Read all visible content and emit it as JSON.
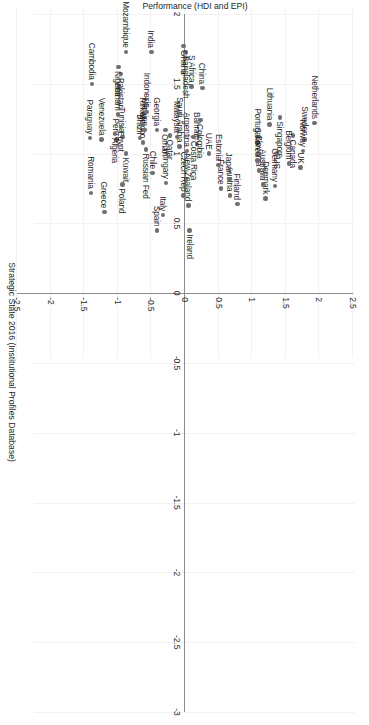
{
  "chart_data": {
    "type": "scatter",
    "title": "",
    "xlabel": "Strategic State 2016 (Institutional Profiles Database)",
    "ylabel": "Performance (HDI and EPI)",
    "xlim": [
      -3,
      2
    ],
    "ylim": [
      -2.5,
      2.5
    ],
    "xticks": [
      2,
      1.5,
      1,
      0.5,
      0,
      -0.5,
      -1,
      -1.5,
      -2,
      -2.5,
      -3
    ],
    "xticklabels": [
      "2",
      "1.5",
      "1",
      "0.5",
      "0",
      "-0.5",
      "-1",
      "-1.5",
      "-2",
      "-2.5",
      "-3"
    ],
    "yticks": [
      2.5,
      2,
      1.5,
      1,
      0.5,
      0,
      -0.5,
      -1,
      -1.5,
      -2,
      -2.5
    ],
    "yticklabels": [
      "2.5",
      "2",
      "1.5",
      "1",
      "0.5",
      "0",
      "-0.5",
      "-1",
      "-1.5",
      "-2",
      "-2.5"
    ],
    "grid": true,
    "legend": "none",
    "marker_color": "#6f6f6f",
    "axis_color": "#8d8d8d",
    "grid_color": "#f2f2f2",
    "points": [
      {
        "label": "Netherlands",
        "x": 1.22,
        "y": 1.93,
        "pos": "l"
      },
      {
        "label": "Sweden",
        "x": 1.1,
        "y": 1.78,
        "pos": "l"
      },
      {
        "label": "Norway",
        "x": 1.02,
        "y": 1.76,
        "pos": "l"
      },
      {
        "label": "UK",
        "x": 0.9,
        "y": 1.72,
        "pos": "l"
      },
      {
        "label": "Canada",
        "x": 1.13,
        "y": 1.61,
        "pos": "r"
      },
      {
        "label": "Belgium",
        "x": 0.93,
        "y": 1.55,
        "pos": "l"
      },
      {
        "label": "Singapore",
        "x": 1.26,
        "y": 1.41,
        "pos": "r"
      },
      {
        "label": "US",
        "x": 1.0,
        "y": 1.37,
        "pos": "r"
      },
      {
        "label": "Germany",
        "x": 0.77,
        "y": 1.34,
        "pos": "l"
      },
      {
        "label": "Lithuania",
        "x": 1.21,
        "y": 1.26,
        "pos": "l"
      },
      {
        "label": "Denmark",
        "x": 0.68,
        "y": 1.2,
        "pos": "l"
      },
      {
        "label": "Australia",
        "x": 0.78,
        "y": 1.16,
        "pos": "l"
      },
      {
        "label": "Portugal",
        "x": 1.08,
        "y": 1.08,
        "pos": "l"
      },
      {
        "label": "Slovenia",
        "x": 0.88,
        "y": 1.1,
        "pos": "l"
      },
      {
        "label": "S Korea",
        "x": 0.95,
        "y": 1.08,
        "pos": "l"
      },
      {
        "label": "Finland",
        "x": 0.64,
        "y": 0.78,
        "pos": "l"
      },
      {
        "label": "Austria",
        "x": 0.7,
        "y": 0.67,
        "pos": "l"
      },
      {
        "label": "Japan",
        "x": 0.82,
        "y": 0.66,
        "pos": "l"
      },
      {
        "label": "France",
        "x": 0.75,
        "y": 0.54,
        "pos": "l"
      },
      {
        "label": "Estonia",
        "x": 0.92,
        "y": 0.5,
        "pos": "l"
      },
      {
        "label": "Bahrain",
        "x": 1.07,
        "y": 0.18,
        "pos": "l"
      },
      {
        "label": "Costa Rica",
        "x": 1.12,
        "y": 0.13,
        "pos": "r"
      },
      {
        "label": "UAE",
        "x": 1.0,
        "y": 0.36,
        "pos": "l"
      },
      {
        "label": "Colombia",
        "x": 1.24,
        "y": 0.23,
        "pos": "r"
      },
      {
        "label": "China",
        "x": 1.47,
        "y": 0.26,
        "pos": "l"
      },
      {
        "label": "S Africa",
        "x": 1.48,
        "y": 0.1,
        "pos": "l"
      },
      {
        "label": "Bangladesh",
        "x": 1.73,
        "y": 0.01,
        "pos": "r"
      },
      {
        "label": "Ghana",
        "x": 1.77,
        "y": -0.02,
        "pos": "r"
      },
      {
        "label": "Ireland",
        "x": 0.45,
        "y": 0.07,
        "pos": "r"
      },
      {
        "label": "New Zealand",
        "x": 0.63,
        "y": 0.05,
        "pos": "l"
      },
      {
        "label": "Czech Rep",
        "x": 0.7,
        "y": -0.02,
        "pos": "l"
      },
      {
        "label": "Argentina",
        "x": 1.02,
        "y": 0.03,
        "pos": "l"
      },
      {
        "label": "Saudi Arabia",
        "x": 1.05,
        "y": -0.08,
        "pos": "l"
      },
      {
        "label": "Malaysia",
        "x": 1.12,
        "y": -0.12,
        "pos": "l"
      },
      {
        "label": "Qatar",
        "x": 1.13,
        "y": -0.22,
        "pos": "r"
      },
      {
        "label": "Oman",
        "x": 1.17,
        "y": -0.29,
        "pos": "r"
      },
      {
        "label": "Hungary",
        "x": 0.79,
        "y": -0.28,
        "pos": "l"
      },
      {
        "label": "Italy",
        "x": 0.56,
        "y": -0.33,
        "pos": "l"
      },
      {
        "label": "Spain",
        "x": 0.45,
        "y": -0.42,
        "pos": "l"
      },
      {
        "label": "Chile",
        "x": 0.86,
        "y": -0.48,
        "pos": "l"
      },
      {
        "label": "Georgia",
        "x": 1.17,
        "y": -0.42,
        "pos": "l"
      },
      {
        "label": "Russian Fed",
        "x": 1.03,
        "y": -0.58,
        "pos": "r"
      },
      {
        "label": "Mexico",
        "x": 1.08,
        "y": -0.62,
        "pos": "l"
      },
      {
        "label": "Brazil",
        "x": 1.11,
        "y": -0.67,
        "pos": "l"
      },
      {
        "label": "Ukraine",
        "x": 1.17,
        "y": -0.6,
        "pos": "l"
      },
      {
        "label": "Turkey",
        "x": 1.21,
        "y": -0.63,
        "pos": "l"
      },
      {
        "label": "Indonesia",
        "x": 1.3,
        "y": -0.57,
        "pos": "l"
      },
      {
        "label": "India",
        "x": 1.73,
        "y": -0.5,
        "pos": "l"
      },
      {
        "label": "Poland",
        "x": 0.78,
        "y": -0.93,
        "pos": "r"
      },
      {
        "label": "Kuwait",
        "x": 1.0,
        "y": -0.88,
        "pos": "r"
      },
      {
        "label": "Tunisia",
        "x": 1.12,
        "y": -0.93,
        "pos": "l"
      },
      {
        "label": "Peru",
        "x": 1.1,
        "y": -1.02,
        "pos": "l"
      },
      {
        "label": "Algeria",
        "x": 1.14,
        "y": -1.04,
        "pos": "r"
      },
      {
        "label": "Egypt",
        "x": 1.19,
        "y": -0.95,
        "pos": "r"
      },
      {
        "label": "Vietnam",
        "x": 1.28,
        "y": -1.0,
        "pos": "l"
      },
      {
        "label": "Pakistan",
        "x": 1.57,
        "y": -0.95,
        "pos": "r"
      },
      {
        "label": "Nigeria",
        "x": 1.62,
        "y": -0.99,
        "pos": "r"
      },
      {
        "label": "Mozambique",
        "x": 1.73,
        "y": -0.88,
        "pos": "l"
      },
      {
        "label": "Greece",
        "x": 0.58,
        "y": -1.2,
        "pos": "l"
      },
      {
        "label": "Venezuela",
        "x": 1.1,
        "y": -1.24,
        "pos": "l"
      },
      {
        "label": "Romania",
        "x": 0.72,
        "y": -1.4,
        "pos": "l"
      },
      {
        "label": "Paraguay",
        "x": 1.11,
        "y": -1.41,
        "pos": "l"
      },
      {
        "label": "Cambodia",
        "x": 1.5,
        "y": -1.38,
        "pos": "l"
      }
    ]
  }
}
